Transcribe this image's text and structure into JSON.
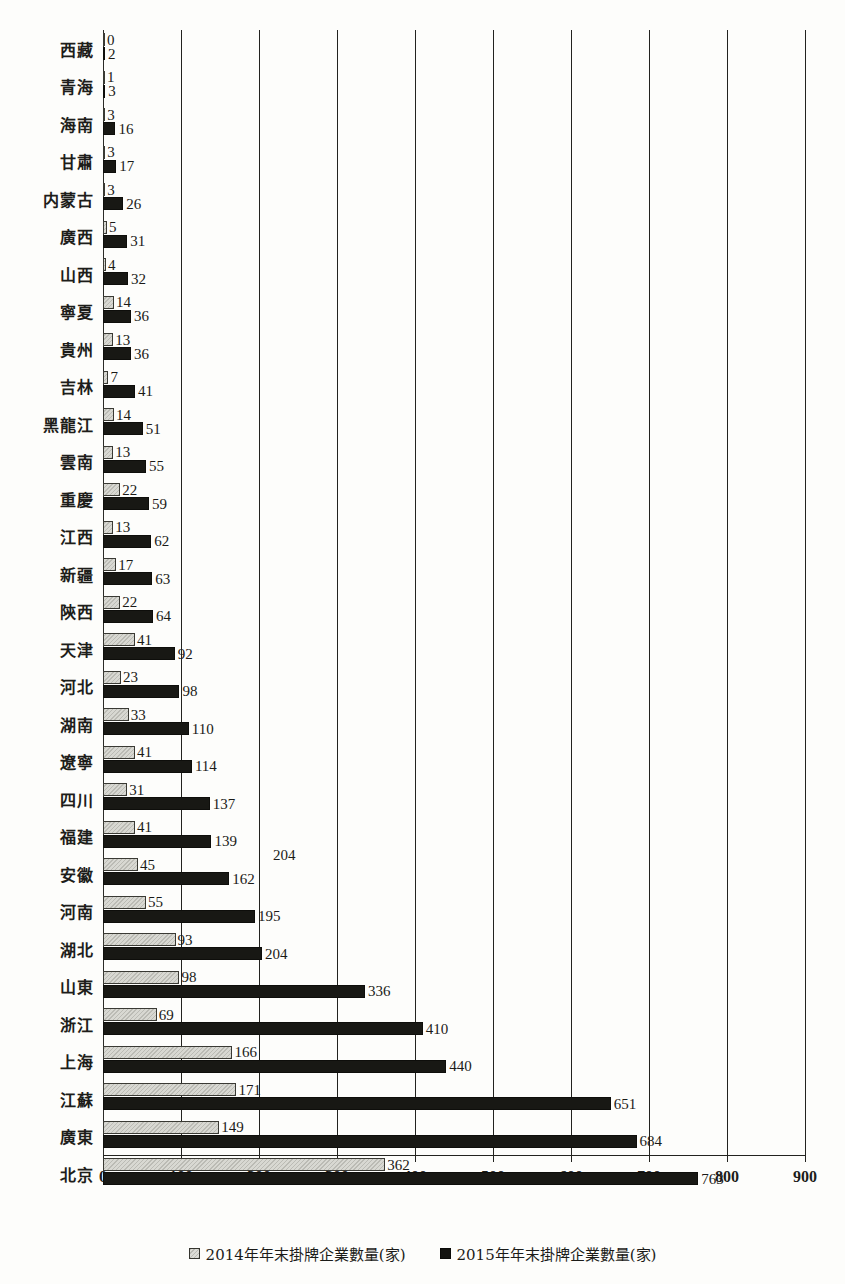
{
  "chart_data": {
    "type": "bar",
    "orientation": "horizontal",
    "title": "",
    "xlabel": "",
    "ylabel": "",
    "xlim": [
      0,
      900
    ],
    "xticks": [
      0,
      100,
      200,
      300,
      400,
      500,
      600,
      700,
      800,
      900
    ],
    "grid": true,
    "grid_axis": "x",
    "legend_position": "bottom-center",
    "categories": [
      "西藏",
      "青海",
      "海南",
      "甘肅",
      "内蒙古",
      "廣西",
      "山西",
      "寧夏",
      "貴州",
      "吉林",
      "黑龍江",
      "雲南",
      "重慶",
      "江西",
      "新疆",
      "陝西",
      "天津",
      "河北",
      "湖南",
      "遼寧",
      "四川",
      "福建",
      "安徽",
      "河南",
      "湖北",
      "山東",
      "浙江",
      "上海",
      "江蘇",
      "廣東",
      "北京"
    ],
    "series": [
      {
        "name": "2014年年末掛牌企業數量(家)",
        "color": "#d8d8d2",
        "values": [
          0,
          1,
          3,
          3,
          3,
          5,
          4,
          14,
          13,
          7,
          14,
          13,
          22,
          13,
          17,
          22,
          41,
          23,
          33,
          41,
          31,
          41,
          45,
          55,
          93,
          98,
          69,
          166,
          171,
          149,
          362
        ]
      },
      {
        "name": "2015年年末掛牌企業數量(家)",
        "color": "#181814",
        "values": [
          2,
          3,
          16,
          17,
          26,
          31,
          32,
          36,
          36,
          41,
          51,
          55,
          59,
          62,
          63,
          64,
          92,
          98,
          110,
          114,
          137,
          139,
          162,
          195,
          204,
          336,
          410,
          440,
          651,
          684,
          763
        ]
      }
    ],
    "stray_labels": [
      {
        "text": "204",
        "x_value": 218,
        "category_index": 22
      }
    ]
  },
  "legend": {
    "items": [
      {
        "label": "2014年年末掛牌企業數量(家)",
        "marker": "hatched-square-icon"
      },
      {
        "label": "2015年年末掛牌企業數量(家)",
        "marker": "filled-square-icon"
      }
    ]
  }
}
